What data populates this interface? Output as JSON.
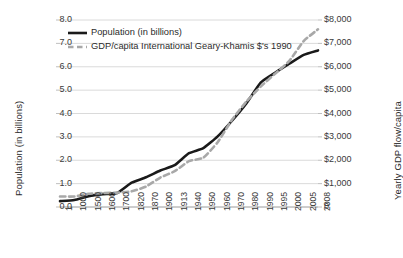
{
  "chart_data": {
    "type": "line",
    "title": "",
    "subtitle": "",
    "xlabel": "",
    "ylabel": "Population (in billions)",
    "y2label": "Yearly GDP flow/capita",
    "grid": "horizontal",
    "legend_position": "inside-top-left",
    "background": "#ffffff",
    "categories": [
      "1",
      "1000",
      "1500",
      "1600",
      "1700",
      "1820",
      "1870",
      "1900",
      "1913",
      "1940",
      "1950",
      "1960",
      "1970",
      "1980",
      "1990",
      "1995",
      "2000",
      "2005",
      "2008"
    ],
    "y_ticks": [
      "0.0",
      "1.0",
      "2.0",
      "3.0",
      "4.0",
      "5.0",
      "6.0",
      "7.0",
      "8.0"
    ],
    "y_tick_values": [
      0,
      1,
      2,
      3,
      4,
      5,
      6,
      7,
      8
    ],
    "ylim": [
      0,
      8
    ],
    "y2_ticks": [
      "0",
      "$1,000",
      "$2,000",
      "$3,000",
      "$4,000",
      "$5,000",
      "$6,000",
      "$7,000",
      "$8,000"
    ],
    "y2_tick_values": [
      0,
      1000,
      2000,
      3000,
      4000,
      5000,
      6000,
      7000,
      8000
    ],
    "y2lim": [
      0,
      8000
    ],
    "series": [
      {
        "name": "Population (in billions)",
        "axis": "left",
        "color": "#1a1a1a",
        "style": "solid",
        "width": 2.6,
        "values": [
          0.25,
          0.3,
          0.46,
          0.55,
          0.6,
          1.04,
          1.27,
          1.56,
          1.79,
          2.3,
          2.52,
          3.02,
          3.69,
          4.43,
          5.32,
          5.74,
          6.13,
          6.51,
          6.7
        ]
      },
      {
        "name": "GDP/capita International Geary-Khamis $'s 1990",
        "axis": "right",
        "color": "#a8a8a8",
        "style": "dashed",
        "width": 2.6,
        "values": [
          450,
          450,
          565,
          595,
          615,
          670,
          875,
          1260,
          1530,
          1960,
          2110,
          2770,
          3730,
          4510,
          5150,
          5700,
          6250,
          7100,
          7600
        ]
      }
    ],
    "legend": [
      {
        "label": "Population (in billions)",
        "style": "solid",
        "color": "#1a1a1a"
      },
      {
        "label": "GDP/capita International Geary-Khamis $'s 1990",
        "style": "dashed",
        "color": "#a8a8a8"
      }
    ]
  }
}
